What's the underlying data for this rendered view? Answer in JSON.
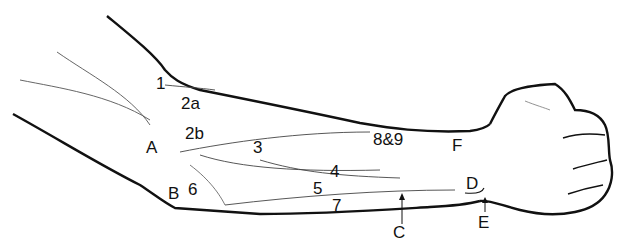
{
  "figure": {
    "line_color": "#111111",
    "thin_line_color": "#555555",
    "background": "#ffffff"
  },
  "labels": {
    "l1": {
      "text": "1",
      "x": 156,
      "y": 75
    },
    "l2a": {
      "text": "2a",
      "x": 181,
      "y": 95
    },
    "l2b": {
      "text": "2b",
      "x": 185,
      "y": 125
    },
    "lA": {
      "text": "A",
      "x": 146,
      "y": 139
    },
    "l3": {
      "text": "3",
      "x": 253,
      "y": 139
    },
    "l89": {
      "text": "8&9",
      "x": 373,
      "y": 131
    },
    "lF": {
      "text": "F",
      "x": 452,
      "y": 137
    },
    "l4": {
      "text": "4",
      "x": 330,
      "y": 163
    },
    "lD": {
      "text": "D",
      "x": 466,
      "y": 175
    },
    "l5": {
      "text": "5",
      "x": 313,
      "y": 180
    },
    "lB": {
      "text": "B",
      "x": 168,
      "y": 185
    },
    "l6": {
      "text": "6",
      "x": 188,
      "y": 181
    },
    "l7": {
      "text": "7",
      "x": 332,
      "y": 197
    },
    "lC": {
      "text": "C",
      "x": 393,
      "y": 224
    },
    "lE": {
      "text": "E",
      "x": 478,
      "y": 214
    }
  }
}
